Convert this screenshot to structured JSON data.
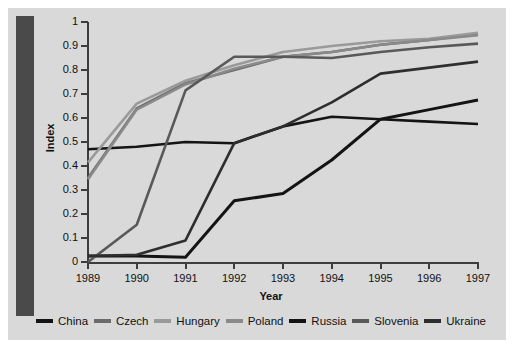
{
  "chart_data": {
    "type": "line",
    "title": "",
    "xlabel": "Year",
    "ylabel": "Index",
    "x": [
      1989,
      1990,
      1991,
      1992,
      1993,
      1994,
      1995,
      1996,
      1997
    ],
    "xtick_labels": [
      "1989",
      "1990",
      "1991",
      "1992",
      "1993",
      "1994",
      "1995",
      "1996",
      "1997"
    ],
    "ytick_labels": [
      "0",
      "0.1",
      "0.2",
      "0.3",
      "0.4",
      "0.5",
      "0.6",
      "0.7",
      "0.8",
      "0.9",
      "1"
    ],
    "ylim": [
      0,
      1
    ],
    "xlim": [
      1989,
      1997
    ],
    "grid": false,
    "legend_position": "bottom",
    "series": [
      {
        "name": "China",
        "color": "#141414",
        "width": 2.6,
        "values": [
          0.47,
          0.48,
          0.5,
          0.495,
          0.565,
          0.605,
          0.595,
          0.585,
          0.575
        ]
      },
      {
        "name": "Czech",
        "color": "#6b6b6b",
        "width": 2.6,
        "values": [
          0.35,
          0.64,
          0.745,
          0.8,
          0.855,
          0.875,
          0.905,
          0.925,
          0.95
        ]
      },
      {
        "name": "Hungary",
        "color": "#9a9a9a",
        "width": 2.6,
        "values": [
          0.415,
          0.66,
          0.755,
          0.82,
          0.875,
          0.9,
          0.92,
          0.93,
          0.955
        ]
      },
      {
        "name": "Poland",
        "color": "#8a8a8a",
        "width": 2.6,
        "values": [
          0.345,
          0.635,
          0.74,
          0.805,
          0.855,
          0.875,
          0.905,
          0.925,
          0.945
        ]
      },
      {
        "name": "Russia",
        "color": "#141414",
        "width": 3.0,
        "values": [
          0.025,
          0.025,
          0.02,
          0.255,
          0.285,
          0.425,
          0.595,
          0.635,
          0.675
        ]
      },
      {
        "name": "Slovenia",
        "color": "#595959",
        "width": 2.6,
        "values": [
          0.0,
          0.155,
          0.715,
          0.855,
          0.855,
          0.85,
          0.875,
          0.895,
          0.91
        ]
      },
      {
        "name": "Ukraine",
        "color": "#2e2e2e",
        "width": 2.6,
        "values": [
          0.025,
          0.03,
          0.09,
          0.495,
          0.565,
          0.665,
          0.785,
          0.81,
          0.835
        ]
      }
    ]
  },
  "figure": {
    "background": "#d9d9d9",
    "left_bar_color": "#4a4a4a",
    "axis_color": "#3d3d3d"
  }
}
